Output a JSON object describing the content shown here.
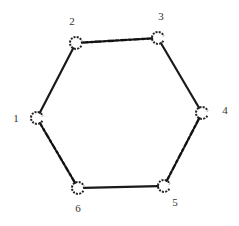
{
  "diagram": {
    "type": "hexagonal-ring-graph",
    "colors": {
      "edge": "#1a1a1a",
      "label": "#333333",
      "background": "#ffffff"
    },
    "nodes": [
      {
        "id": "1",
        "label": "1",
        "x": 37,
        "y": 118,
        "label_x": 16,
        "label_y": 122
      },
      {
        "id": "2",
        "label": "2",
        "x": 76,
        "y": 43,
        "label_x": 72,
        "label_y": 25
      },
      {
        "id": "3",
        "label": "3",
        "x": 158,
        "y": 38,
        "label_x": 161,
        "label_y": 20
      },
      {
        "id": "4",
        "label": "4",
        "x": 202,
        "y": 113,
        "label_x": 225,
        "label_y": 114
      },
      {
        "id": "5",
        "label": "5",
        "x": 164,
        "y": 186,
        "label_x": 175,
        "label_y": 206
      },
      {
        "id": "6",
        "label": "6",
        "x": 78,
        "y": 188,
        "label_x": 78,
        "label_y": 212
      }
    ],
    "edges": [
      {
        "from": "1",
        "to": "2"
      },
      {
        "from": "2",
        "to": "3"
      },
      {
        "from": "3",
        "to": "4"
      },
      {
        "from": "4",
        "to": "5"
      },
      {
        "from": "5",
        "to": "6"
      },
      {
        "from": "6",
        "to": "1"
      }
    ]
  }
}
